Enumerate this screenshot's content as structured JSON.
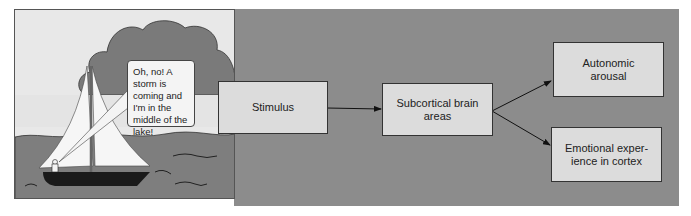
{
  "scene": {
    "speech_bubble": "Oh, no! A storm is coming and I'm in the middle of the lake!"
  },
  "flow": {
    "stimulus": "Stimulus",
    "subcortical": "Subcortical brain areas",
    "autonomic": "Autonomic arousal",
    "emotional": "Emotional exper- ience in cortex"
  },
  "colors": {
    "panel_gray": "#8c8c8c",
    "box_fill": "#dcdcdc",
    "cloud": "#7a7a7a",
    "water": "#7e7e7e",
    "sky": "#e8e8e8"
  }
}
